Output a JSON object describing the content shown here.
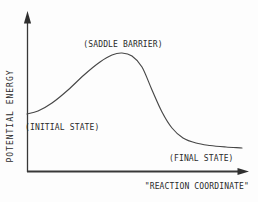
{
  "figure": {
    "type": "reaction-coordinate-energy-diagram",
    "background_color": "#fdfdfd",
    "ink_color": "#2b2b2b",
    "curve_color": "#474747",
    "labels": {
      "saddle_barrier": "(SADDLE BARRIER)",
      "initial_state": "(INITIAL STATE)",
      "final_state": "(FINAL STATE)",
      "y_axis": "POTENTIAL ENERGY",
      "x_axis": "\"REACTION COORDINATE\""
    },
    "curve_points": [
      [
        27,
        114
      ],
      [
        38,
        111
      ],
      [
        52,
        103
      ],
      [
        68,
        90
      ],
      [
        84,
        75
      ],
      [
        100,
        62
      ],
      [
        112,
        55
      ],
      [
        122,
        53
      ],
      [
        132,
        56
      ],
      [
        142,
        67
      ],
      [
        152,
        90
      ],
      [
        162,
        112
      ],
      [
        172,
        128
      ],
      [
        183,
        138
      ],
      [
        196,
        143
      ],
      [
        210,
        145.5
      ],
      [
        226,
        147
      ],
      [
        242,
        148
      ]
    ],
    "annotations": [
      {
        "text": "(SADDLE BARRIER)",
        "anchors": "curve peak"
      },
      {
        "text": "(INITIAL STATE)",
        "anchors": "curve start plateau"
      },
      {
        "text": "(FINAL STATE)",
        "anchors": "curve end plateau"
      }
    ]
  }
}
